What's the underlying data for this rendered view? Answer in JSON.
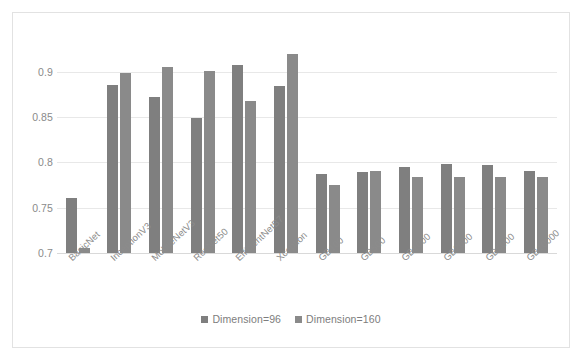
{
  "chart_data": {
    "type": "bar",
    "title": "",
    "xlabel": "",
    "ylabel": "",
    "ylim": [
      0.7,
      0.925
    ],
    "yticks": [
      "0.7",
      "0.75",
      "0.8",
      "0.85",
      "0.9"
    ],
    "ytick_values": [
      0.7,
      0.75,
      0.8,
      0.85,
      0.9
    ],
    "grid": true,
    "legend_position": "bottom",
    "categories": [
      "BasicNet",
      "InceptionV3",
      "MobileNetV3",
      "ResNet50",
      "EfficientNetB7",
      "Xception",
      "GB100",
      "GB500",
      "GB1000",
      "GB2000",
      "GB5000",
      "GB10000"
    ],
    "series": [
      {
        "name": "Dimension=96",
        "color": "#7f7f7f",
        "values": [
          0.761,
          0.885,
          0.872,
          0.849,
          0.907,
          0.884,
          0.787,
          0.789,
          0.795,
          0.798,
          0.797,
          0.79
        ]
      },
      {
        "name": "Dimension=160",
        "color": "#8a8a8a",
        "values": [
          0.706,
          0.898,
          0.905,
          0.901,
          0.868,
          0.919,
          0.775,
          0.791,
          0.784,
          0.784,
          0.784,
          0.784
        ]
      }
    ]
  },
  "colors": {
    "frame_border": "#e2e2e2",
    "gridline": "#e8e8e8",
    "axis_text": "#8a8a8a",
    "series_1": "#7f7f7f",
    "series_2": "#8a8a8a",
    "background": "#ffffff"
  }
}
